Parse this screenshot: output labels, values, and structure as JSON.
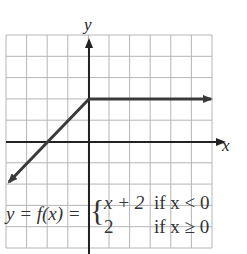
{
  "figure": {
    "axis_labels": {
      "x": "x",
      "y": "y"
    },
    "grid": {
      "x_min": -4,
      "x_max": 6,
      "y_min": -5,
      "y_max": 5,
      "step": 1
    },
    "equation": {
      "lhs": "y = f(x) =",
      "case1_expr": "x + 2",
      "case1_cond": "if x < 0",
      "case2_expr": "2",
      "case2_cond": "if x ≥ 0"
    },
    "colors": {
      "grid": "#b5b5b5",
      "axis": "#222222",
      "graph": "#3a3a3a",
      "text": "#333333"
    }
  },
  "chart_data": {
    "type": "line",
    "title": "",
    "xlabel": "x",
    "ylabel": "y",
    "xlim": [
      -4,
      6
    ],
    "ylim": [
      -5,
      5
    ],
    "grid": true,
    "series": [
      {
        "name": "y = x + 2 (x < 0)",
        "x": [
          -4,
          0
        ],
        "y": [
          -2,
          2
        ],
        "arrow_at_start": true
      },
      {
        "name": "y = 2 (x ≥ 0)",
        "x": [
          0,
          6
        ],
        "y": [
          2,
          2
        ],
        "arrow_at_end": true
      }
    ]
  }
}
